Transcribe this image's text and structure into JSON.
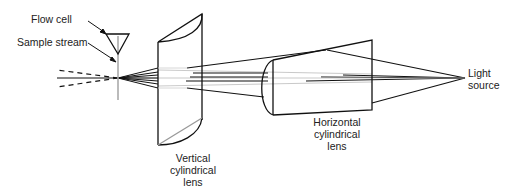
{
  "diagram": {
    "type": "optical-schematic",
    "labels": {
      "flow_cell": "Flow cell",
      "sample_stream": "Sample stream",
      "light_source_1": "Light",
      "light_source_2": "source",
      "horizontal_lens_1": "Horizontal",
      "horizontal_lens_2": "cylindrical",
      "horizontal_lens_3": "lens",
      "vertical_lens_1": "Vertical",
      "vertical_lens_2": "cylindrical",
      "vertical_lens_3": "lens"
    },
    "colors": {
      "stroke": "#111111",
      "faint_ray": "#bbbbbb",
      "stream": "#aaaaaa"
    }
  }
}
